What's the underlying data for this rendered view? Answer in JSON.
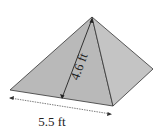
{
  "figure": {
    "shape": "square pyramid",
    "labels": {
      "slant_height": "4.6 ft",
      "base_edge": "5.5 ft"
    },
    "colors": {
      "face_left": "#b9b9b9",
      "face_right": "#c4c4c4",
      "edge": "#333333",
      "background": "#ffffff"
    }
  }
}
